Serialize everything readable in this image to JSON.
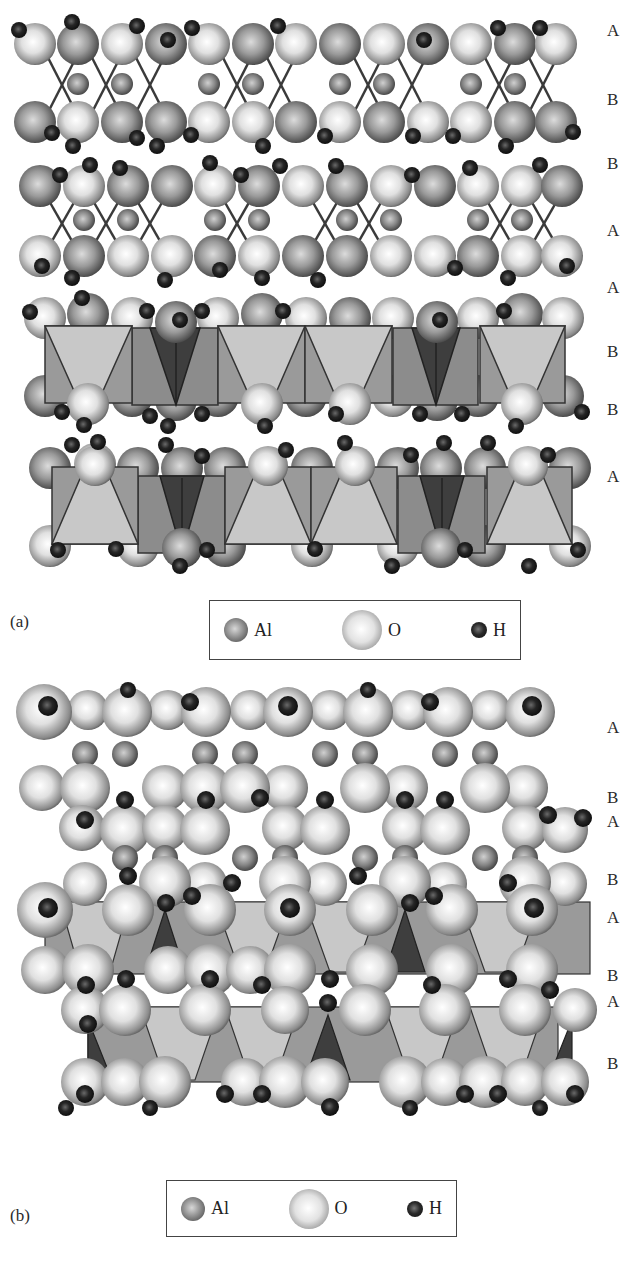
{
  "figure": {
    "panel_a": {
      "label": "(a)",
      "layer_labels": [
        "A",
        "B",
        "B",
        "A",
        "A",
        "B",
        "B",
        "A"
      ],
      "legend": {
        "items": [
          {
            "symbol": "Al",
            "label": "Al",
            "icon": "al-sphere-icon",
            "color": "#8a8a8a"
          },
          {
            "symbol": "O",
            "label": "O",
            "icon": "o-sphere-icon",
            "color": "#e6e6e6"
          },
          {
            "symbol": "H",
            "label": "H",
            "icon": "h-sphere-icon",
            "color": "#1a1a1a"
          }
        ]
      }
    },
    "panel_b": {
      "label": "(b)",
      "layer_labels": [
        "A",
        "B",
        "A",
        "B",
        "A",
        "B",
        "A",
        "B"
      ],
      "legend": {
        "items": [
          {
            "symbol": "Al",
            "label": "Al",
            "icon": "al-sphere-icon",
            "color": "#8a8a8a"
          },
          {
            "symbol": "O",
            "label": "O",
            "icon": "o-sphere-icon",
            "color": "#e6e6e6"
          },
          {
            "symbol": "H",
            "label": "H",
            "icon": "h-sphere-icon",
            "color": "#1a1a1a"
          }
        ]
      }
    },
    "colors": {
      "octahedron_light": "#c8c8c8",
      "octahedron_mid": "#9a9a9a",
      "octahedron_dark": "#3e3e3e",
      "bond": "#3a3a3a"
    }
  }
}
